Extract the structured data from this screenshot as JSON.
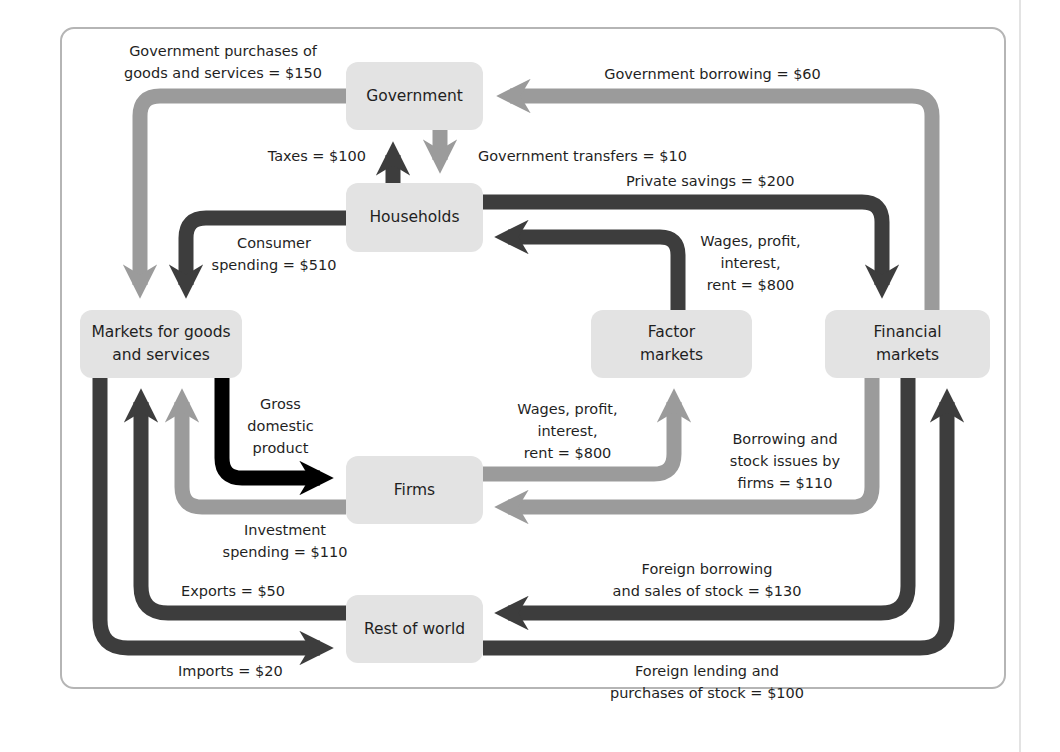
{
  "diagram": {
    "title": "",
    "type": "circular-flow",
    "colors": {
      "dark_flow": "#3d3d3d",
      "light_flow": "#9b9b9b",
      "gdp_flow": "#000000",
      "box_fill": "#e3e3e3",
      "frame": "#b5b5b5"
    },
    "nodes": {
      "government": "Government",
      "households": "Households",
      "markets_goods": "Markets for goods\nand services",
      "factor_markets": "Factor\nmarkets",
      "financial_markets": "Financial\nmarkets",
      "firms": "Firms",
      "rest_of_world": "Rest of world"
    },
    "flows": {
      "gov_purchases": "Government purchases of\ngoods and services = $150",
      "gov_borrowing": "Government borrowing = $60",
      "taxes": "Taxes = $100",
      "gov_transfers": "Government transfers = $10",
      "private_savings": "Private savings = $200",
      "consumer_spending": "Consumer\nspending = $510",
      "wages_to_households": "Wages, profit,\ninterest,\nrent = $800",
      "gdp": "Gross\ndomestic\nproduct",
      "wages_from_firms": "Wages, profit,\ninterest,\nrent = $800",
      "borrowing_firms": "Borrowing and\nstock issues by\nfirms = $110",
      "investment_spending": "Investment\nspending = $110",
      "exports": "Exports = $50",
      "imports": "Imports = $20",
      "foreign_borrowing": "Foreign borrowing\nand sales of stock = $130",
      "foreign_lending": "Foreign lending and\npurchases of stock = $100"
    }
  }
}
